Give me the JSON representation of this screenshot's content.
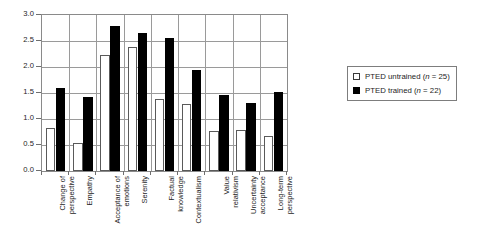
{
  "chart_data": {
    "type": "bar",
    "title": "",
    "subtitle": "",
    "xlabel": "",
    "ylabel": "",
    "ylim": [
      0.0,
      3.0
    ],
    "ytick_labels": [
      "3.0",
      "2.5",
      "2.0",
      "1.5",
      "1.0",
      "0.5",
      "0.0"
    ],
    "ytick_values": [
      3.0,
      2.5,
      2.0,
      1.5,
      1.0,
      0.5,
      0.0
    ],
    "grid": true,
    "grid_axis": "y",
    "legend_position": "right",
    "categories": [
      "Change of perspective",
      "Empathy",
      "Acceptance of emotions",
      "Serenity",
      "Factual knowledge",
      "Contextualism",
      "Value relativism",
      "Uncertainty acceptance",
      "Long-term perspective"
    ],
    "category_lines": [
      [
        "Change of",
        "perspective"
      ],
      [
        "Empathy"
      ],
      [
        "Acceptance of",
        "emotions"
      ],
      [
        "Serenity"
      ],
      [
        "Factual",
        "knowledge"
      ],
      [
        "Contextualism"
      ],
      [
        "Value",
        "relativism"
      ],
      [
        "Uncertainty",
        "acceptance"
      ],
      [
        "Long-term",
        "perspective"
      ]
    ],
    "series": [
      {
        "name": "PTED untrained (n = 25)",
        "label_text": "PTED untrained (",
        "label_italic": "n",
        "label_tail": " = 25)",
        "color": "#ffffff",
        "edge_color": "#5a5a5a",
        "values": [
          0.82,
          0.54,
          2.23,
          2.38,
          1.38,
          1.29,
          0.77,
          0.78,
          0.68
        ]
      },
      {
        "name": "PTED trained (n = 22)",
        "label_text": "PTED trained (",
        "label_italic": "n",
        "label_tail": " = 22)",
        "color": "#000000",
        "edge_color": "#000000",
        "values": [
          1.6,
          1.42,
          2.79,
          2.65,
          2.56,
          1.94,
          1.47,
          1.31,
          1.52
        ]
      }
    ]
  }
}
